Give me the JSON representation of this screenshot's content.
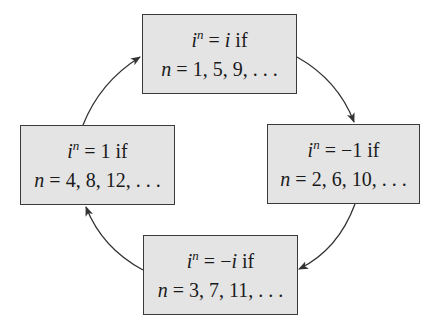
{
  "diagram": {
    "type": "cycle",
    "nodes": [
      {
        "id": "top",
        "position": "top",
        "line1": {
          "base": "i",
          "exp": "n",
          "eq": " = ",
          "value": "i",
          "value_italic": true,
          "suffix": " if"
        },
        "line2": {
          "var": "n",
          "eq": " = ",
          "values": "1, 5, 9, . . ."
        }
      },
      {
        "id": "right",
        "position": "right",
        "line1": {
          "base": "i",
          "exp": "n",
          "eq": " = ",
          "value": "−1",
          "value_italic": false,
          "suffix": " if"
        },
        "line2": {
          "var": "n",
          "eq": " = ",
          "values": "2, 6, 10, . . ."
        }
      },
      {
        "id": "bottom",
        "position": "bottom",
        "line1": {
          "base": "i",
          "exp": "n",
          "eq": " = ",
          "value_prefix": "−",
          "value": "i",
          "value_italic": true,
          "suffix": " if"
        },
        "line2": {
          "var": "n",
          "eq": " = ",
          "values": "3, 7, 11, . . ."
        }
      },
      {
        "id": "left",
        "position": "left",
        "line1": {
          "base": "i",
          "exp": "n",
          "eq": " = ",
          "value": "1",
          "value_italic": false,
          "suffix": " if"
        },
        "line2": {
          "var": "n",
          "eq": " = ",
          "values": "4, 8, 12, . . ."
        }
      }
    ],
    "edges": [
      {
        "from": "top",
        "to": "right",
        "direction": "clockwise"
      },
      {
        "from": "right",
        "to": "bottom",
        "direction": "clockwise"
      },
      {
        "from": "bottom",
        "to": "left",
        "direction": "clockwise"
      },
      {
        "from": "left",
        "to": "top",
        "direction": "clockwise"
      }
    ],
    "colors": {
      "box_fill": "#e4e4e4",
      "box_border": "#3a3a3a",
      "arrow": "#333333",
      "text": "#1a1a1a"
    }
  }
}
